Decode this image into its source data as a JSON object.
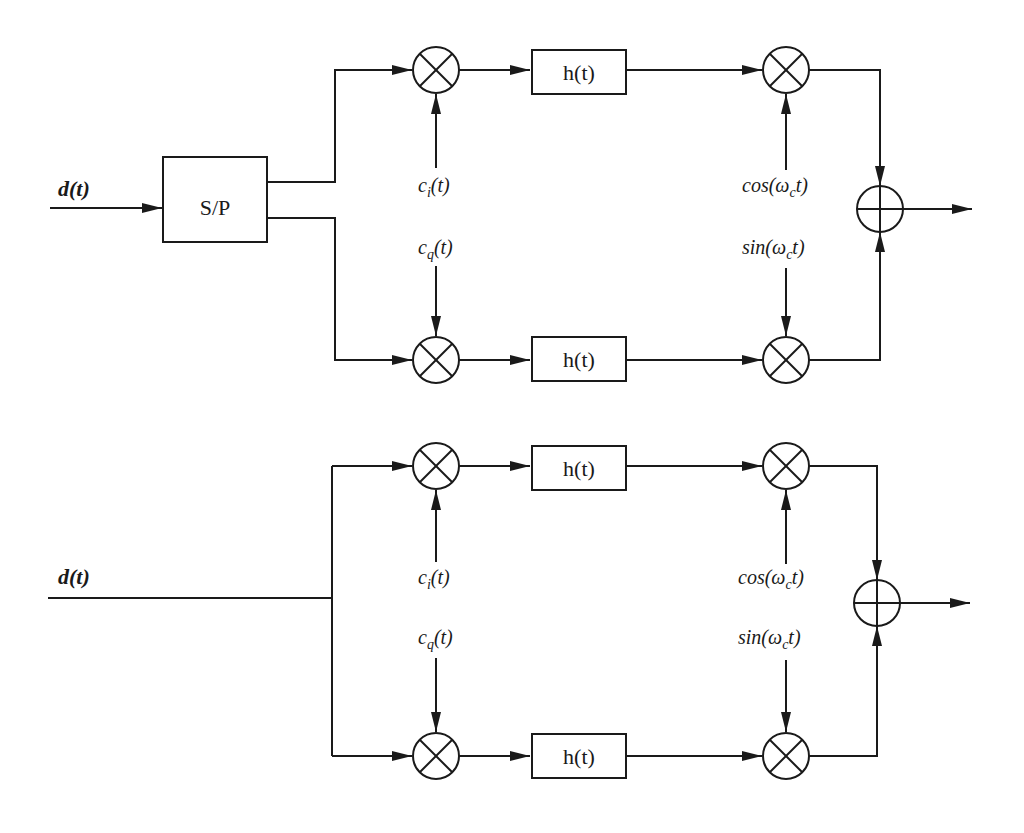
{
  "diagram": {
    "title": "",
    "colors": {
      "ink": "#1a1a1a",
      "background": "#ffffff"
    },
    "top": {
      "input_label": "d(t)",
      "sp_box_label": "S/P",
      "filter_upper_label": "h(t)",
      "filter_lower_label": "h(t)",
      "code_i_label": "c",
      "code_i_sub": "i",
      "code_q_label": "c",
      "code_q_sub": "q",
      "arg_t": "(t)",
      "carrier_cos_prefix": "cos(ω",
      "carrier_sin_prefix": "sin(ω",
      "carrier_sub": "c",
      "carrier_suffix": "t)"
    },
    "bottom": {
      "input_label": "d(t)",
      "filter_upper_label": "h(t)",
      "filter_lower_label": "h(t)",
      "code_i_label": "c",
      "code_i_sub": "i",
      "code_q_label": "c",
      "code_q_sub": "q",
      "arg_t": "(t)",
      "carrier_cos_prefix": "cos(ω",
      "carrier_sin_prefix": "sin(ω",
      "carrier_sub": "c",
      "carrier_suffix": "t)"
    },
    "nodes": [
      "serial-to-parallel-converter",
      "multiplier-i-code",
      "multiplier-q-code",
      "pulse-shaping-filter-i",
      "pulse-shaping-filter-q",
      "multiplier-cos-carrier",
      "multiplier-sin-carrier",
      "summer"
    ]
  }
}
